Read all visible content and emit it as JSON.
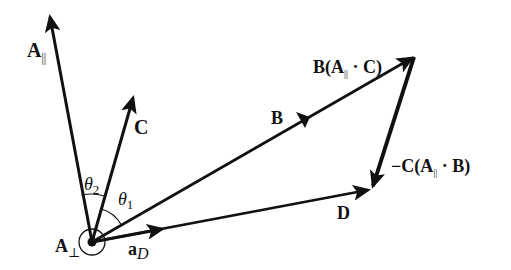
{
  "diagram": {
    "colors": {
      "ink": "#111111",
      "background": "#ffffff"
    },
    "origin": {
      "x": 92,
      "y": 242,
      "label": "A",
      "label_sub": "⊥"
    },
    "vectors": [
      {
        "id": "A_parallel",
        "label": "A",
        "label_sub": "||",
        "from": [
          92,
          242
        ],
        "to": [
          50,
          15
        ]
      },
      {
        "id": "C",
        "label": "C",
        "from": [
          92,
          242
        ],
        "to": [
          133,
          96
        ]
      },
      {
        "id": "B",
        "label": "B",
        "from": [
          92,
          242
        ],
        "to": [
          414,
          57
        ],
        "mid_arrow": true
      },
      {
        "id": "D",
        "label": "D",
        "from": [
          92,
          242
        ],
        "to": [
          370,
          190
        ]
      },
      {
        "id": "a_D",
        "label": "a",
        "label_sub": "D",
        "from": [
          92,
          242
        ],
        "to": [
          158,
          230
        ]
      },
      {
        "id": "minus_C",
        "label": "−C(A",
        "label_sub": "||",
        "label_tail": " · B)",
        "from": [
          414,
          57
        ],
        "to": [
          373,
          188
        ]
      }
    ],
    "vertex_label": {
      "prefix": "B(A",
      "sub": "||",
      "suffix": " · C)"
    },
    "angles": [
      {
        "id": "theta_2",
        "symbol": "θ",
        "sub": "2"
      },
      {
        "id": "theta_1",
        "symbol": "θ",
        "sub": "1"
      }
    ]
  }
}
